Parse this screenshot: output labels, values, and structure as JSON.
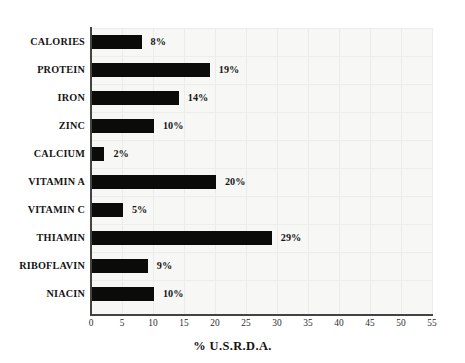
{
  "chart_data": {
    "type": "bar",
    "orientation": "horizontal",
    "title": "",
    "xlabel": "% U.S.R.D.A.",
    "ylabel": "",
    "xlim": [
      0,
      55
    ],
    "xticks": [
      0,
      5,
      10,
      15,
      20,
      25,
      30,
      35,
      40,
      45,
      50,
      55
    ],
    "xtick_labels": [
      "0",
      "5",
      "10",
      "15",
      "20",
      "25",
      "30",
      "35",
      "40",
      "45",
      "50",
      "55"
    ],
    "grid": true,
    "legend": "none",
    "bar_color": "#0b0b0a",
    "plot_background": "#f7f7f6",
    "categories": [
      "CALORIES",
      "PROTEIN",
      "IRON",
      "ZINC",
      "CALCIUM",
      "VITAMIN A",
      "VITAMIN C",
      "THIAMIN",
      "RIBOFLAVIN",
      "NIACIN"
    ],
    "values": [
      8,
      19,
      14,
      10,
      2,
      20,
      5,
      29,
      9,
      10
    ],
    "data_labels": [
      "8%",
      "19%",
      "14%",
      "10%",
      "2%",
      "20%",
      "5%",
      "29%",
      "9%",
      "10%"
    ],
    "bars": [
      {
        "category": "CALORIES",
        "value": 8,
        "label": "8%"
      },
      {
        "category": "PROTEIN",
        "value": 19,
        "label": "19%"
      },
      {
        "category": "IRON",
        "value": 14,
        "label": "14%"
      },
      {
        "category": "ZINC",
        "value": 10,
        "label": "10%"
      },
      {
        "category": "CALCIUM",
        "value": 2,
        "label": "2%"
      },
      {
        "category": "VITAMIN A",
        "value": 20,
        "label": "20%"
      },
      {
        "category": "VITAMIN C",
        "value": 5,
        "label": "5%"
      },
      {
        "category": "THIAMIN",
        "value": 29,
        "label": "29%"
      },
      {
        "category": "RIBOFLAVIN",
        "value": 9,
        "label": "9%"
      },
      {
        "category": "NIACIN",
        "value": 10,
        "label": "10%"
      }
    ]
  }
}
